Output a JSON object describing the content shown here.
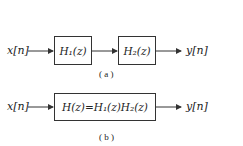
{
  "diagram_a": {
    "input_label": "x[n]",
    "block1_label": "H₁(z)",
    "block2_label": "H₂(z)",
    "output_label": "y[n]",
    "caption": "( a )"
  },
  "diagram_b": {
    "input_label": "x[n]",
    "block_label": "H(z)=H₁(z)H₂(z)",
    "output_label": "y[n]",
    "caption": "( b )"
  },
  "colors": {
    "line": "#333333",
    "background": "#ffffff"
  }
}
